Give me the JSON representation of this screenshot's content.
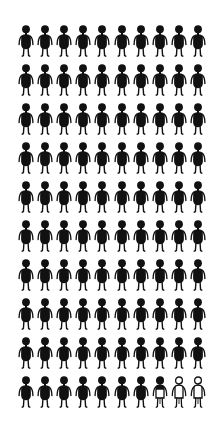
{
  "chart_data": {
    "type": "pictograph",
    "title": "",
    "rows": 10,
    "columns": 10,
    "total_icons": 100,
    "filled_full": 97,
    "partial_fill_fraction": 0.3,
    "empty": 2,
    "value_percent": 97.3,
    "icon": "person",
    "colors": {
      "filled": "#111111",
      "empty_fill": "#ffffff",
      "outline": "#111111",
      "background": "#ffffff"
    },
    "layout": {
      "origin_x": 26,
      "origin_y": 25,
      "step_x": 19.1,
      "step_y": 39
    }
  }
}
